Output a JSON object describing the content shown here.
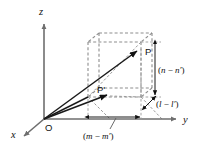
{
  "figure": {
    "background_color": "#ffffff",
    "axis_color": "#6e6e6e",
    "vector_color": "#1a1a1a",
    "box_color": "#8d8d8d",
    "axes": [
      {
        "id": "z",
        "label": "z",
        "label_x": 39,
        "label_y": 14,
        "direction": "up"
      },
      {
        "id": "y",
        "label": "y",
        "label_x": 184,
        "label_y": 123,
        "direction": "right"
      },
      {
        "id": "x",
        "label": "x",
        "label_x": 12,
        "label_y": 137,
        "direction": "down-left"
      }
    ],
    "points": [
      {
        "id": "origin",
        "label": "O",
        "label_x": 45,
        "label_y": 130,
        "x": 44,
        "y": 119
      },
      {
        "id": "P",
        "label": "P",
        "label_x": 146,
        "label_y": 55,
        "x": 140,
        "y": 49
      },
      {
        "id": "P-prime",
        "label": "P'",
        "label_x": 98,
        "label_y": 92,
        "x": 110,
        "y": 96
      }
    ],
    "dimensions": [
      {
        "id": "n-minus-n-prime",
        "open_paren": "(",
        "var1": "n",
        "minus": " − ",
        "var2": "n′",
        "close_paren": ")",
        "label_x": 159,
        "label_y": 72,
        "orientation": "vertical"
      },
      {
        "id": "l-minus-l-prime",
        "open_paren": "(",
        "var1": "l",
        "minus": " − ",
        "var2": "l′",
        "close_paren": ")",
        "label_x": 155,
        "label_y": 106,
        "orientation": "diagonal"
      },
      {
        "id": "m-minus-m-prime",
        "open_paren": "(",
        "var1": "m",
        "minus": " − ",
        "var2": "m′",
        "close_paren": ")",
        "label_x": 84,
        "label_y": 137,
        "orientation": "horizontal"
      }
    ]
  }
}
